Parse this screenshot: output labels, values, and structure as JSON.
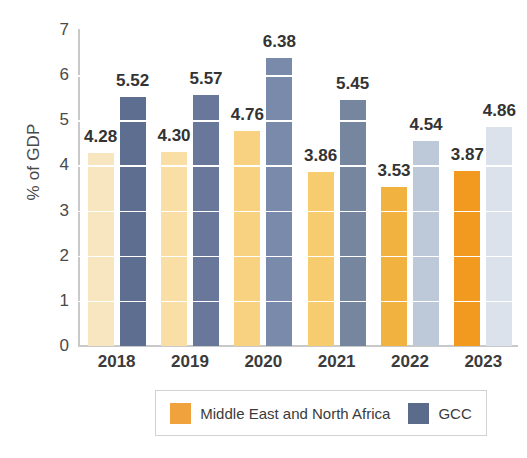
{
  "chart_data": {
    "type": "bar",
    "title": "",
    "xlabel": "",
    "ylabel": "% of GDP",
    "categories": [
      "2018",
      "2019",
      "2020",
      "2021",
      "2022",
      "2023"
    ],
    "series": [
      {
        "name": "Middle East and North Africa",
        "values": [
          4.28,
          4.3,
          4.76,
          3.86,
          3.53,
          3.87
        ],
        "labels": [
          "4.28",
          "4.30",
          "4.76",
          "3.86",
          "3.53",
          "3.87"
        ],
        "colors": [
          "#F7E6C0",
          "#F9DFA6",
          "#F8D281",
          "#F7CC6F",
          "#F2B23F",
          "#F2991F"
        ],
        "legend_color": "#F0A23C"
      },
      {
        "name": "GCC",
        "values": [
          5.52,
          5.57,
          6.38,
          5.45,
          4.54,
          4.86
        ],
        "labels": [
          "5.52",
          "5.57",
          "6.38",
          "5.45",
          "4.54",
          "4.86"
        ],
        "colors": [
          "#5E6E90",
          "#68779A",
          "#7A8AAA",
          "#77869F",
          "#BDC8D8",
          "#DCE2EC"
        ],
        "legend_color": "#5A6B8C"
      }
    ],
    "yticks": [
      "0",
      "1",
      "2",
      "3",
      "4",
      "5",
      "6",
      "7"
    ],
    "ylim": [
      0,
      7
    ],
    "grid": true,
    "grid_color": "#FFFFFF",
    "legend_position": "bottom"
  }
}
